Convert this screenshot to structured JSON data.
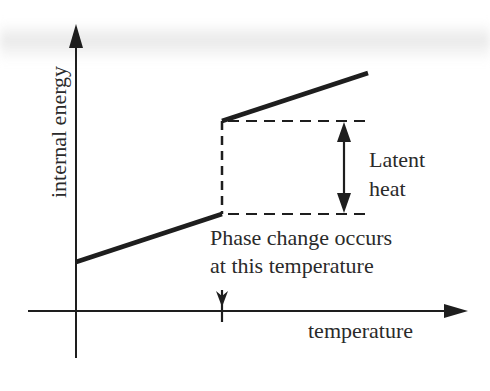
{
  "diagram": {
    "y_axis_label": "internal energy",
    "x_axis_label": "temperature",
    "latent_heat_label": {
      "line1": "Latent",
      "line2": "heat"
    },
    "phase_change_label": {
      "line1": "Phase change occurs",
      "line2": "at this temperature"
    },
    "colors": {
      "line": "#1e1e1e",
      "text": "#2a2a2a",
      "background": "#ffffff"
    },
    "segments": [
      {
        "name": "below-phase-change",
        "style": "solid",
        "from": [
          0,
          0.2
        ],
        "to": [
          1,
          0.45
        ]
      },
      {
        "name": "jump-at-phase-change",
        "style": "dashed",
        "from": [
          1,
          0.45
        ],
        "to": [
          1,
          0.9
        ]
      },
      {
        "name": "above-phase-change",
        "style": "solid",
        "from": [
          1,
          0.9
        ],
        "to": [
          2,
          1.15
        ]
      }
    ]
  }
}
